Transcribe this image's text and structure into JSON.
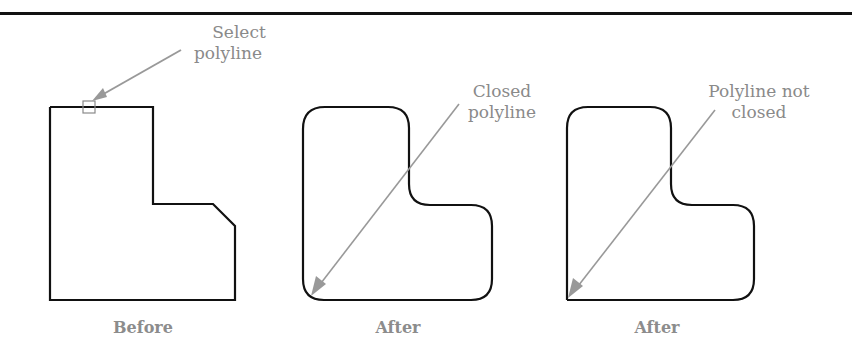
{
  "figure": {
    "panels": [
      {
        "id": "before",
        "caption": "Before",
        "callout": {
          "line1": "Select",
          "line2": "polyline"
        }
      },
      {
        "id": "after-closed",
        "caption": "After",
        "callout": {
          "line1": "Closed",
          "line2": "polyline"
        }
      },
      {
        "id": "after-not-closed",
        "caption": "After",
        "callout": {
          "line1": "Polyline not",
          "line2": "closed"
        }
      }
    ],
    "colors": {
      "outline": "#111111",
      "leader": "#999999",
      "label": "#8a8a8a"
    }
  }
}
